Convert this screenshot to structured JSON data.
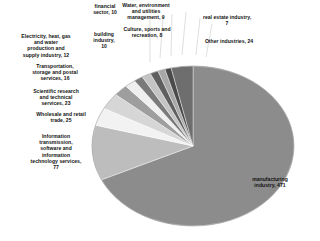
{
  "chart_data": {
    "type": "pie",
    "title": "",
    "subtitle": "",
    "xlabel": "",
    "ylabel": "",
    "grid": false,
    "legend_position": "none",
    "label_format": "name, value",
    "total": 692,
    "categories": [
      "manufacturing industry",
      "Information transmission, software and information technology services",
      "Wholesale and retail trade",
      "Scientific research and technical services",
      "Transportation, storage and postal services",
      "Electricity, heat, gas and water production and supply industry",
      "financial sector",
      "building industry",
      "Water, environment and utilities management",
      "Culture, sports and recreation",
      "real estate industry",
      "Other industries"
    ],
    "values": [
      471,
      77,
      25,
      23,
      16,
      12,
      10,
      10,
      9,
      8,
      7,
      24
    ],
    "slice_colors": [
      "#8c8c8c",
      "#bdbdbd",
      "#f2f2f2",
      "#d6d6d6",
      "#9e9e9e",
      "#efefef",
      "#7a7a7a",
      "#c4c4c4",
      "#5f5f5f",
      "#a8a8a8",
      "#4a4a4a",
      "#6e6e6e"
    ]
  },
  "labels": {
    "financial": "financial\nsector, 10",
    "water": "Water, environment\nand utilities\nmanagement, 9",
    "real_estate": "real estate industry,\n7",
    "culture": "Culture, sports and\nrecreation, 8",
    "other": "Other industries, 24",
    "electricity": "Electricity, heat, gas\nand water\nproduction and\nsupply industry, 12",
    "building": "building\nindustry,\n10",
    "transport": "Transportation,\nstorage and postal\nservices, 16",
    "scientific": "Scientific research\nand technical\nservices, 23",
    "wholesale": "Wholesale and retail\ntrade, 25",
    "info_trans": "Information\ntransmission,\nsoftware and\ninformation\ntechnology services,\n77",
    "manufacturing": "manufacturing\nindustry, 471"
  },
  "colors": {
    "background": "#ffffff",
    "text": "#111111",
    "leader_line": "#c8c8c8",
    "pie_outline": "#8a8a8a",
    "largest_slice": "#8c8c8c",
    "second_slice": "#bdbdbd"
  }
}
